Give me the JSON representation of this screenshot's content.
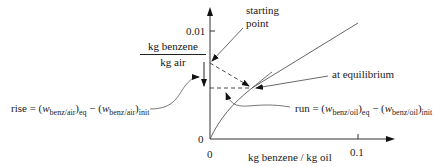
{
  "diagram": {
    "y_axis": {
      "label_numerator": "kg benzene",
      "label_denominator": "kg air",
      "tick_top": "0.01",
      "tick_origin": "0"
    },
    "x_axis": {
      "label": "kg benzene / kg oil",
      "tick_origin": "0",
      "tick_right": "0.1"
    },
    "annotations": {
      "starting_point_line1": "starting",
      "starting_point_line2": "point",
      "equilibrium": "at equilibrium",
      "rise": {
        "prefix": "rise = (",
        "w1": "w",
        "sub1": "benz/air",
        "close1": ")",
        "eq": "eq",
        "minus": " − (",
        "w2": "w",
        "sub2": "benz/air",
        "close2": ")",
        "init": "init"
      },
      "run": {
        "prefix": "run = (",
        "w1": "w",
        "sub1": "benz/oil",
        "close1": ")",
        "eq": "eq",
        "minus": " − (",
        "w2": "w",
        "sub2": "benz/oil",
        "close2": ")",
        "init": "init"
      }
    },
    "colors": {
      "line": "#444444",
      "axis": "#333333",
      "text": "#1a1a1a"
    }
  }
}
